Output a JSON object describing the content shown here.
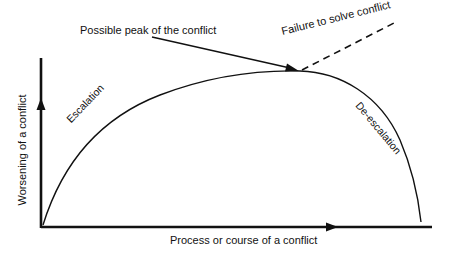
{
  "diagram": {
    "type": "conflict-course-curve",
    "labels": {
      "peak": "Possible peak of the conflict",
      "failure": "Failure to solve conflict",
      "escalation": "Escalation",
      "deescalation": "De-escalation",
      "y_axis": "Worsening of a conflict",
      "x_axis": "Process or course of a conflict"
    },
    "colors": {
      "line": "#111111",
      "background": "#ffffff"
    },
    "shapes": {
      "y_axis": {
        "x": 41,
        "y_top": 58,
        "y_bottom": 228,
        "arrow_y": 105
      },
      "x_axis": {
        "y": 227,
        "x_start": 41,
        "x_end": 432,
        "arrow_x": 332
      },
      "curve_path": "M 43 225 C 60 170, 95 120, 160 95 C 210 76, 260 70, 300 71 C 340 72, 380 95, 400 140 C 412 168, 418 195, 421 222",
      "dashed_line": {
        "x1": 300,
        "y1": 71,
        "x2": 396,
        "y2": 22
      },
      "peak_arrow": {
        "x1": 152,
        "y1": 37,
        "x2": 297,
        "y2": 70
      }
    }
  }
}
